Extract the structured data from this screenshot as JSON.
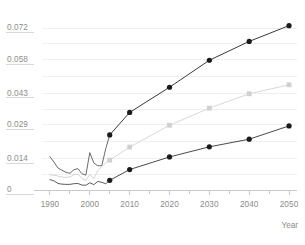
{
  "chart_data": {
    "type": "line",
    "title": "",
    "subtitle": "",
    "xlabel": "Year",
    "ylabel": "",
    "grid": true,
    "legend": "none",
    "xlim": [
      1988,
      2052
    ],
    "ylim": [
      0,
      0.0765
    ],
    "x_ticks": [
      1990,
      2000,
      2010,
      2020,
      2030,
      2040,
      2050
    ],
    "x_tick_labels": [
      "1990",
      "2000",
      "2010",
      "2020",
      "2030",
      "2040",
      "2050"
    ],
    "y_ticks": [
      0,
      0.014,
      0.029,
      0.043,
      0.058,
      0.072
    ],
    "y_tick_labels": [
      "0",
      "0.014",
      "0.029",
      "0.043",
      "0.058",
      "0.072"
    ],
    "series": [
      {
        "name": "upper-projection",
        "color": "#3a3a3a",
        "marker": "circle",
        "marker_color": "#1a1a1a",
        "x": [
          2005,
          2010,
          2020,
          2030,
          2040,
          2050
        ],
        "values": [
          0.0245,
          0.0345,
          0.0457,
          0.0577,
          0.0661,
          0.0731
        ]
      },
      {
        "name": "middle-projection",
        "color": "#d9d9d9",
        "marker": "square",
        "marker_color": "#d0d0d0",
        "x": [
          2005,
          2010,
          2020,
          2030,
          2040,
          2050
        ],
        "values": [
          0.0133,
          0.0191,
          0.0288,
          0.0364,
          0.0428,
          0.0468
        ]
      },
      {
        "name": "lower-projection",
        "color": "#4a4a4a",
        "marker": "circle",
        "marker_color": "#1a1a1a",
        "x": [
          2005,
          2010,
          2020,
          2030,
          2040,
          2050
        ],
        "values": [
          0.0043,
          0.0091,
          0.0147,
          0.0192,
          0.0226,
          0.0285
        ]
      },
      {
        "name": "history-upper",
        "color": "#5a5a5a",
        "marker": "none",
        "x": [
          1990,
          1991,
          1992,
          1993,
          1994,
          1995,
          1996,
          1997,
          1998,
          1999,
          2000,
          2001,
          2002,
          2003,
          2004,
          2005
        ],
        "values": [
          0.0148,
          0.0124,
          0.0098,
          0.0088,
          0.0079,
          0.0074,
          0.009,
          0.0095,
          0.0073,
          0.0066,
          0.0166,
          0.012,
          0.0108,
          0.0108,
          0.0184,
          0.0245
        ]
      },
      {
        "name": "history-middle",
        "color": "#cfcfcf",
        "marker": "none",
        "x": [
          1990,
          1991,
          1992,
          1993,
          1994,
          1995,
          1996,
          1997,
          1998,
          1999,
          2000,
          2001,
          2002,
          2003,
          2004,
          2005
        ],
        "values": [
          0.0068,
          0.0066,
          0.0062,
          0.0058,
          0.0056,
          0.0058,
          0.0068,
          0.007,
          0.0052,
          0.0042,
          0.007,
          0.005,
          0.0086,
          0.0104,
          0.012,
          0.0133
        ]
      },
      {
        "name": "history-lower",
        "color": "#4a4a4a",
        "marker": "none",
        "x": [
          1990,
          1991,
          1992,
          1993,
          1994,
          1995,
          1996,
          1997,
          1998,
          1999,
          2000,
          2001,
          2002,
          2003,
          2004,
          2005
        ],
        "values": [
          0.0046,
          0.0041,
          0.0029,
          0.0026,
          0.0025,
          0.0025,
          0.0028,
          0.0029,
          0.0022,
          0.0021,
          0.0032,
          0.0024,
          0.0038,
          0.0034,
          0.0028,
          0.0043
        ]
      }
    ]
  },
  "colors": {
    "background": "#ffffff",
    "gridline": "#efefef",
    "axis": "#c9c9c9",
    "tick_label": "#8c8c8c",
    "series_dark": "#3a3a3a",
    "series_light": "#d9d9d9",
    "series_mid": "#4a4a4a"
  }
}
